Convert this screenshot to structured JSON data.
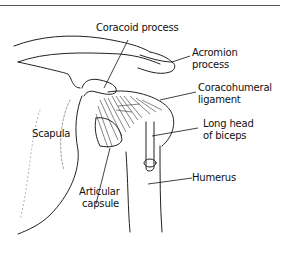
{
  "figure": {
    "labels": {
      "coracoid": "Coracoid process",
      "acromion_1": "Acromion",
      "acromion_2": "process",
      "coracohumeral_1": "Coracohumeral",
      "coracohumeral_2": "ligament",
      "scapula": "Scapula",
      "biceps_1": "Long head",
      "biceps_2": "of biceps",
      "humerus": "Humerus",
      "capsule_1": "Articular",
      "capsule_2": "capsule"
    }
  }
}
